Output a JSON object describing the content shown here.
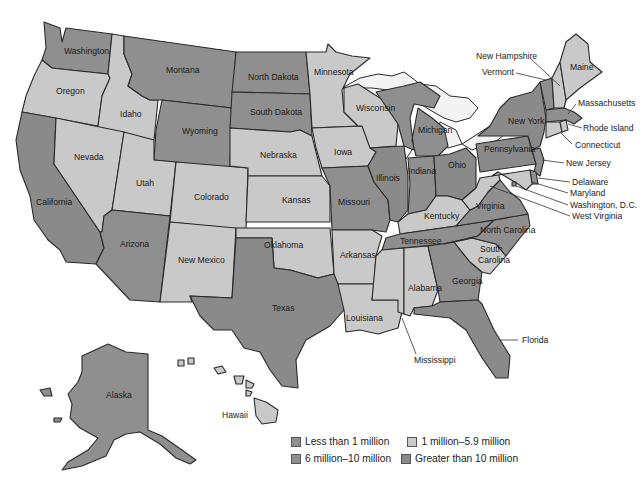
{
  "map": {
    "type": "choropleth",
    "subject": "United States population by state",
    "colors": {
      "lt1": "#8f8f8f",
      "1to6": "#c9c9c9",
      "6to10": "#8f8f8f",
      "gt10": "#8a8a8a",
      "lake": "#f4f4f4",
      "stroke": "#2a2a2a"
    }
  },
  "legend": {
    "items": [
      {
        "key": "lt1",
        "label": "Less than 1 million",
        "color": "#8f8f8f"
      },
      {
        "key": "1to6",
        "label": "1 million–5.9 million",
        "color": "#c9c9c9"
      },
      {
        "key": "6to10",
        "label": "6 million–10 million",
        "color": "#8f8f8f"
      },
      {
        "key": "gt10",
        "label": "Greater than 10 million",
        "color": "#8a8a8a"
      }
    ]
  },
  "states": {
    "washington": {
      "label": "Washington",
      "class": "6to10"
    },
    "oregon": {
      "label": "Oregon",
      "class": "1to6"
    },
    "california": {
      "label": "California",
      "class": "gt10"
    },
    "idaho": {
      "label": "Idaho",
      "class": "1to6"
    },
    "nevada": {
      "label": "Nevada",
      "class": "1to6"
    },
    "montana": {
      "label": "Montana",
      "class": "lt1"
    },
    "wyoming": {
      "label": "Wyoming",
      "class": "lt1"
    },
    "utah": {
      "label": "Utah",
      "class": "1to6"
    },
    "arizona": {
      "label": "Arizona",
      "class": "6to10"
    },
    "colorado": {
      "label": "Colorado",
      "class": "1to6"
    },
    "new_mexico": {
      "label": "New Mexico",
      "class": "1to6"
    },
    "north_dakota": {
      "label": "North Dakota",
      "class": "lt1"
    },
    "south_dakota": {
      "label": "South Dakota",
      "class": "lt1"
    },
    "nebraska": {
      "label": "Nebraska",
      "class": "1to6"
    },
    "kansas": {
      "label": "Kansas",
      "class": "1to6"
    },
    "oklahoma": {
      "label": "Oklahoma",
      "class": "1to6"
    },
    "texas": {
      "label": "Texas",
      "class": "gt10"
    },
    "minnesota": {
      "label": "Minnesota",
      "class": "1to6"
    },
    "iowa": {
      "label": "Iowa",
      "class": "1to6"
    },
    "missouri": {
      "label": "Missouri",
      "class": "6to10"
    },
    "arkansas": {
      "label": "Arkansas",
      "class": "1to6"
    },
    "louisiana": {
      "label": "Louisiana",
      "class": "1to6"
    },
    "wisconsin": {
      "label": "Wisconsin",
      "class": "1to6"
    },
    "illinois": {
      "label": "Illinois",
      "class": "gt10"
    },
    "michigan": {
      "label": "Michigan",
      "class": "6to10"
    },
    "indiana": {
      "label": "Indiana",
      "class": "6to10"
    },
    "ohio": {
      "label": "Ohio",
      "class": "gt10"
    },
    "kentucky": {
      "label": "Kentucky",
      "class": "1to6"
    },
    "tennessee": {
      "label": "Tennessee",
      "class": "6to10"
    },
    "mississippi": {
      "label": "Mississippi",
      "class": "1to6"
    },
    "alabama": {
      "label": "Alabama",
      "class": "1to6"
    },
    "georgia": {
      "label": "Georgia",
      "class": "6to10"
    },
    "florida": {
      "label": "Florida",
      "class": "gt10"
    },
    "south_carolina": {
      "label": "South Carolina",
      "class": "1to6"
    },
    "north_carolina": {
      "label": "North Carolina",
      "class": "6to10"
    },
    "virginia": {
      "label": "Virginia",
      "class": "6to10"
    },
    "west_virginia": {
      "label": "West Virginia",
      "class": "1to6"
    },
    "pennsylvania": {
      "label": "Pennsylvania",
      "class": "gt10"
    },
    "new_york": {
      "label": "New York",
      "class": "gt10"
    },
    "new_jersey": {
      "label": "New Jersey",
      "class": "6to10"
    },
    "delaware": {
      "label": "Delaware",
      "class": "lt1"
    },
    "maryland": {
      "label": "Maryland",
      "class": "1to6"
    },
    "washington_dc": {
      "label": "Washington, D.C.",
      "class": "lt1"
    },
    "connecticut": {
      "label": "Connecticut",
      "class": "1to6"
    },
    "rhode_island": {
      "label": "Rhode Island",
      "class": "1to6"
    },
    "massachusetts": {
      "label": "Massachusetts",
      "class": "6to10"
    },
    "vermont": {
      "label": "Vermont",
      "class": "lt1"
    },
    "new_hampshire": {
      "label": "New Hampshire",
      "class": "1to6"
    },
    "maine": {
      "label": "Maine",
      "class": "1to6"
    },
    "alaska": {
      "label": "Alaska",
      "class": "lt1"
    },
    "hawaii": {
      "label": "Hawaii",
      "class": "1to6"
    }
  }
}
